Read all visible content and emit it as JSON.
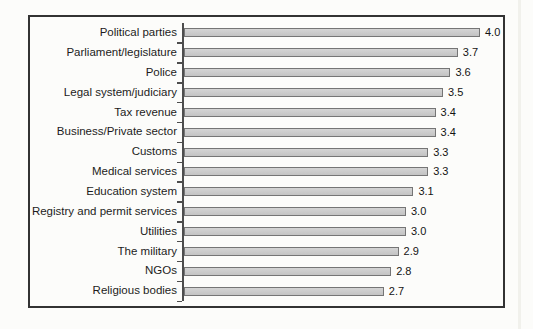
{
  "chart_data": {
    "type": "bar",
    "orientation": "horizontal",
    "title": "",
    "xlabel": "",
    "ylabel": "",
    "xlim": [
      0,
      4.3
    ],
    "grid": false,
    "legend": null,
    "categories": [
      "Political parties",
      "Parliament/legislature",
      "Police",
      "Legal system/judiciary",
      "Tax revenue",
      "Business/Private sector",
      "Customs",
      "Medical services",
      "Education system",
      "Registry and permit services",
      "Utilities",
      "The military",
      "NGOs",
      "Religious bodies"
    ],
    "values": [
      4.0,
      3.7,
      3.6,
      3.5,
      3.4,
      3.4,
      3.3,
      3.3,
      3.1,
      3.0,
      3.0,
      2.9,
      2.8,
      2.7
    ],
    "value_labels": [
      "4.0",
      "3.7",
      "3.6",
      "3.5",
      "3.4",
      "3.4",
      "3.3",
      "3.3",
      "3.1",
      "3.0",
      "3.0",
      "2.9",
      "2.8",
      "2.7"
    ],
    "bar_fill_color": "#c9c9c9",
    "bar_border_color": "#757575",
    "axis_color": "#4d4d4d",
    "frame_border_color": "#333333",
    "background_color": "#fcfcfa",
    "label_text_color": "#1c1c1c"
  }
}
